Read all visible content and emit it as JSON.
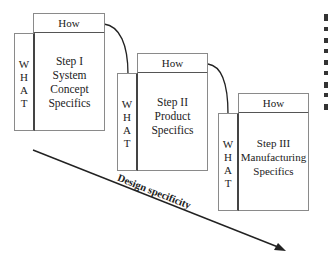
{
  "diagram": {
    "steps": [
      {
        "how_label": "How",
        "what_letters": [
          "W",
          "H",
          "A",
          "T"
        ],
        "title": "Step I",
        "lines": [
          "System",
          "Concept",
          "Specifics"
        ]
      },
      {
        "how_label": "How",
        "what_letters": [
          "W",
          "H",
          "A",
          "T"
        ],
        "title": "Step II",
        "lines": [
          "Product",
          "Specifics"
        ]
      },
      {
        "how_label": "How",
        "what_letters": [
          "W",
          "H",
          "A",
          "T"
        ],
        "title": "Step III",
        "lines": [
          "Manufacturing",
          "Specifics"
        ]
      }
    ],
    "arrow_label": "Design specificity",
    "colors": {
      "border": "#8a8a8a",
      "divider": "#444444",
      "text": "#222222",
      "background": "#ffffff"
    }
  }
}
